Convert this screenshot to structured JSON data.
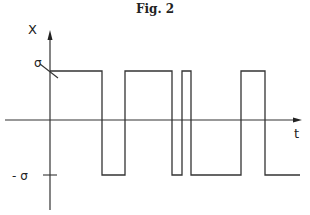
{
  "title": "Fig. 2",
  "chart_data": {
    "type": "line",
    "subtype": "step / rectangular pulse waveform",
    "title": "Fig. 2",
    "xlabel": "t",
    "ylabel": "X",
    "ytick_labels": [
      "σ",
      "- σ"
    ],
    "levels": {
      "high": "σ",
      "low": "-σ"
    },
    "grid": false,
    "legend": null,
    "segments": [
      {
        "level": "σ",
        "x_start_px": 50,
        "x_end_px": 102
      },
      {
        "level": "-σ",
        "x_start_px": 102,
        "x_end_px": 125
      },
      {
        "level": "σ",
        "x_start_px": 125,
        "x_end_px": 172
      },
      {
        "level": "-σ",
        "x_start_px": 172,
        "x_end_px": 182
      },
      {
        "level": "σ",
        "x_start_px": 182,
        "x_end_px": 191
      },
      {
        "level": "-σ",
        "x_start_px": 191,
        "x_end_px": 241
      },
      {
        "level": "σ",
        "x_start_px": 241,
        "x_end_px": 265
      },
      {
        "level": "-σ",
        "x_start_px": 265,
        "x_end_px": 300
      }
    ]
  },
  "labels": {
    "x_axis": "t",
    "y_axis": "X",
    "high": "σ",
    "low": "- σ"
  },
  "geometry": {
    "axis_y": 120,
    "axis_x": 50,
    "high_y": 71,
    "low_y": 175,
    "h_axis_start": 5,
    "h_axis_end": 302,
    "v_axis_top": 30,
    "v_axis_bottom": 210
  }
}
